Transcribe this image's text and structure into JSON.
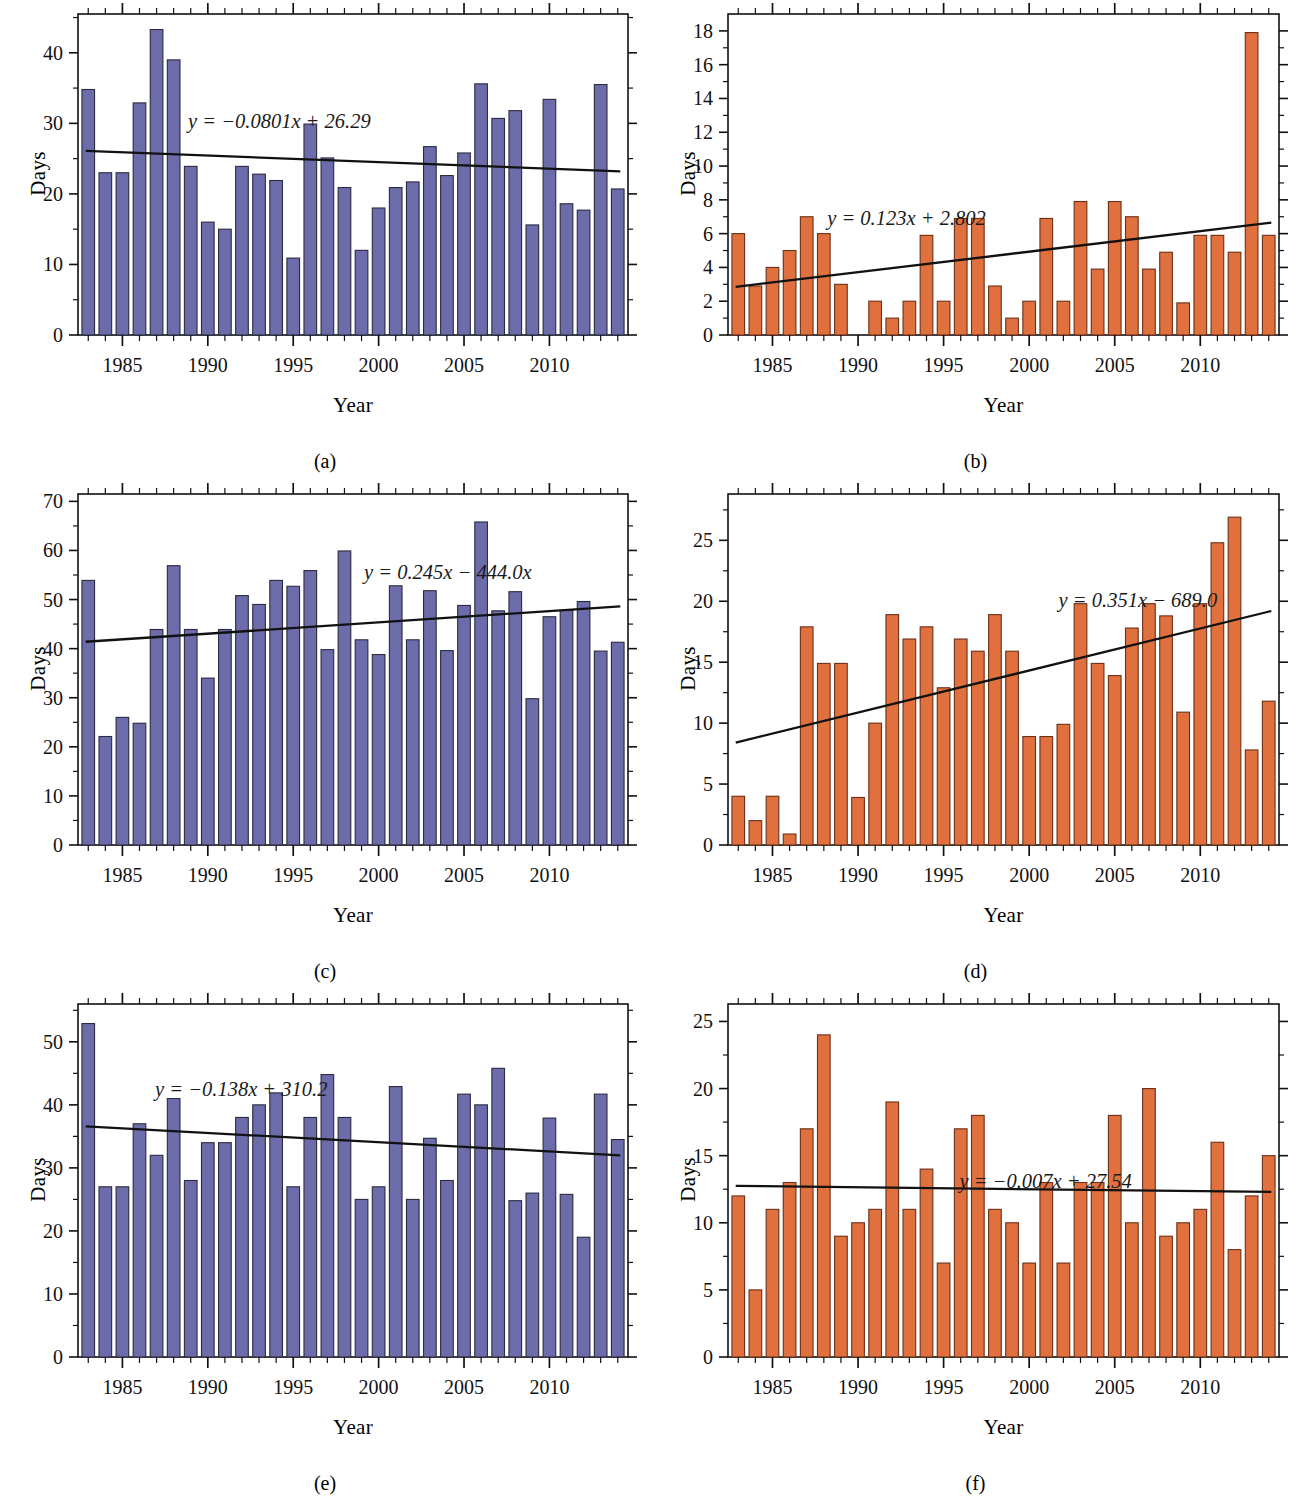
{
  "figure": {
    "background": "#ffffff",
    "purple": "#6d6caa",
    "purple_edge": "#2a2a40",
    "orange": "#e1703f",
    "orange_edge": "#6b2f16",
    "trend_color": "#111111",
    "axis_color": "#111111"
  },
  "panels": [
    {
      "id": "a",
      "caption": "(a)",
      "color_key": "purple",
      "chart_data": {
        "type": "bar",
        "title": "",
        "xlabel": "Year",
        "ylabel": "Days",
        "xlim": [
          1982.4,
          2014.6
        ],
        "ylim": [
          0,
          45.5
        ],
        "yticks": [
          0,
          10,
          20,
          30,
          40
        ],
        "ytick_labels": [
          "0",
          "10",
          "20",
          "30",
          "40"
        ],
        "xticks": [
          1985,
          1990,
          1995,
          2000,
          2005,
          2010
        ],
        "xtick_labels": [
          "1985",
          "1990",
          "1995",
          "2000",
          "2005",
          "2010"
        ],
        "grid": false,
        "categories": [
          1983,
          1984,
          1985,
          1986,
          1987,
          1988,
          1989,
          1990,
          1991,
          1992,
          1993,
          1994,
          1995,
          1996,
          1997,
          1998,
          1999,
          2000,
          2001,
          2002,
          2003,
          2004,
          2005,
          2006,
          2007,
          2008,
          2009,
          2010,
          2011,
          2012,
          2013,
          2014
        ],
        "values": [
          34.8,
          23.0,
          23.0,
          32.9,
          43.3,
          39.0,
          23.9,
          16.0,
          15.0,
          23.9,
          22.8,
          21.9,
          10.9,
          29.9,
          25.1,
          20.9,
          12.0,
          18.0,
          20.9,
          21.7,
          26.7,
          22.6,
          25.8,
          35.6,
          30.7,
          31.8,
          15.6,
          33.4,
          18.6,
          17.7,
          35.5,
          20.7
        ],
        "trendline": {
          "label": "y = −0.0801x + 26.29",
          "slope": -0.0801,
          "intercept_display": "26.29",
          "y_start": 26.1,
          "y_end": 23.2
        }
      }
    },
    {
      "id": "b",
      "caption": "(b)",
      "color_key": "orange",
      "chart_data": {
        "type": "bar",
        "title": "",
        "xlabel": "Year",
        "ylabel": "Days",
        "xlim": [
          1982.4,
          2014.6
        ],
        "ylim": [
          0,
          19.0
        ],
        "yticks": [
          0,
          2,
          4,
          6,
          8,
          10,
          12,
          14,
          16,
          18
        ],
        "ytick_labels": [
          "0",
          "2",
          "4",
          "6",
          "8",
          "10",
          "12",
          "14",
          "16",
          "18"
        ],
        "xticks": [
          1985,
          1990,
          1995,
          2000,
          2005,
          2010
        ],
        "xtick_labels": [
          "1985",
          "1990",
          "1995",
          "2000",
          "2005",
          "2010"
        ],
        "grid": false,
        "categories": [
          1983,
          1984,
          1985,
          1986,
          1987,
          1988,
          1989,
          1990,
          1991,
          1992,
          1993,
          1994,
          1995,
          1996,
          1997,
          1998,
          1999,
          2000,
          2001,
          2002,
          2003,
          2004,
          2005,
          2006,
          2007,
          2008,
          2009,
          2010,
          2011,
          2012,
          2013,
          2014
        ],
        "values": [
          6.0,
          2.9,
          4.0,
          5.0,
          7.0,
          6.0,
          3.0,
          0.0,
          2.0,
          1.0,
          2.0,
          5.9,
          2.0,
          6.9,
          6.9,
          2.9,
          1.0,
          2.0,
          6.9,
          2.0,
          7.9,
          3.9,
          7.9,
          7.0,
          3.9,
          4.9,
          1.9,
          5.9,
          5.9,
          4.9,
          17.9,
          5.9
        ],
        "trendline": {
          "label": "y = 0.123x + 2.802",
          "slope": 0.123,
          "intercept_display": "2.802",
          "y_start": 2.85,
          "y_end": 6.65
        }
      }
    },
    {
      "id": "c",
      "caption": "(c)",
      "color_key": "purple",
      "chart_data": {
        "type": "bar",
        "title": "",
        "xlabel": "Year",
        "ylabel": "Days",
        "xlim": [
          1982.4,
          2014.6
        ],
        "ylim": [
          0,
          71.5
        ],
        "yticks": [
          0,
          10,
          20,
          30,
          40,
          50,
          60,
          70
        ],
        "ytick_labels": [
          "0",
          "10",
          "20",
          "30",
          "40",
          "50",
          "60",
          "70"
        ],
        "xticks": [
          1985,
          1990,
          1995,
          2000,
          2005,
          2010
        ],
        "xtick_labels": [
          "1985",
          "1990",
          "1995",
          "2000",
          "2005",
          "2010"
        ],
        "grid": false,
        "categories": [
          1983,
          1984,
          1985,
          1986,
          1987,
          1988,
          1989,
          1990,
          1991,
          1992,
          1993,
          1994,
          1995,
          1996,
          1997,
          1998,
          1999,
          2000,
          2001,
          2002,
          2003,
          2004,
          2005,
          2006,
          2007,
          2008,
          2009,
          2010,
          2011,
          2012,
          2013,
          2014
        ],
        "values": [
          53.9,
          22.1,
          26.0,
          24.8,
          43.9,
          56.9,
          43.9,
          34.0,
          43.9,
          50.8,
          49.0,
          53.9,
          52.7,
          55.9,
          39.8,
          59.9,
          41.8,
          38.8,
          52.8,
          41.8,
          51.8,
          39.6,
          48.8,
          65.8,
          47.7,
          51.6,
          29.8,
          46.5,
          47.8,
          49.6,
          39.5,
          41.3
        ],
        "trendline": {
          "label": "y = 0.245x − 444.0x",
          "slope": 0.245,
          "intercept_display": "444.0x",
          "y_start": 41.4,
          "y_end": 48.6
        }
      }
    },
    {
      "id": "d",
      "caption": "(d)",
      "color_key": "orange",
      "chart_data": {
        "type": "bar",
        "title": "",
        "xlabel": "Year",
        "ylabel": "Days",
        "xlim": [
          1982.4,
          2014.6
        ],
        "ylim": [
          0,
          28.8
        ],
        "yticks": [
          0,
          5,
          10,
          15,
          20,
          25
        ],
        "ytick_labels": [
          "0",
          "5",
          "10",
          "15",
          "20",
          "25"
        ],
        "xticks": [
          1985,
          1990,
          1995,
          2000,
          2005,
          2010
        ],
        "xtick_labels": [
          "1985",
          "1990",
          "1995",
          "2000",
          "2005",
          "2010"
        ],
        "grid": false,
        "categories": [
          1983,
          1984,
          1985,
          1986,
          1987,
          1988,
          1989,
          1990,
          1991,
          1992,
          1993,
          1994,
          1995,
          1996,
          1997,
          1998,
          1999,
          2000,
          2001,
          2002,
          2003,
          2004,
          2005,
          2006,
          2007,
          2008,
          2009,
          2010,
          2011,
          2012,
          2013,
          2014
        ],
        "values": [
          4.0,
          2.0,
          4.0,
          0.9,
          17.9,
          14.9,
          14.9,
          3.9,
          10.0,
          18.9,
          16.9,
          17.9,
          12.9,
          16.9,
          15.9,
          18.9,
          15.9,
          8.9,
          8.9,
          9.9,
          19.8,
          14.9,
          13.9,
          17.8,
          19.8,
          18.8,
          10.9,
          19.8,
          24.8,
          26.9,
          7.8,
          11.8
        ],
        "trendline": {
          "label": "y = 0.351x − 689.0",
          "slope": 0.351,
          "intercept_display": "689.0",
          "y_start": 8.4,
          "y_end": 19.2
        }
      }
    },
    {
      "id": "e",
      "caption": "(e)",
      "color_key": "purple",
      "chart_data": {
        "type": "bar",
        "title": "",
        "xlabel": "Year",
        "ylabel": "Days",
        "xlim": [
          1982.4,
          2014.6
        ],
        "ylim": [
          0,
          56.0
        ],
        "yticks": [
          0,
          10,
          20,
          30,
          40,
          50
        ],
        "ytick_labels": [
          "0",
          "10",
          "20",
          "30",
          "40",
          "50"
        ],
        "xticks": [
          1985,
          1990,
          1995,
          2000,
          2005,
          2010
        ],
        "xtick_labels": [
          "1985",
          "1990",
          "1995",
          "2000",
          "2005",
          "2010"
        ],
        "grid": false,
        "categories": [
          1983,
          1984,
          1985,
          1986,
          1987,
          1988,
          1989,
          1990,
          1991,
          1992,
          1993,
          1994,
          1995,
          1996,
          1997,
          1998,
          1999,
          2000,
          2001,
          2002,
          2003,
          2004,
          2005,
          2006,
          2007,
          2008,
          2009,
          2010,
          2011,
          2012,
          2013,
          2014
        ],
        "values": [
          52.9,
          27.0,
          27.0,
          37.0,
          32.0,
          41.0,
          28.0,
          34.0,
          34.0,
          38.0,
          40.0,
          41.9,
          27.0,
          38.0,
          44.8,
          38.0,
          25.0,
          27.0,
          42.9,
          25.0,
          34.7,
          28.0,
          41.7,
          40.0,
          45.8,
          24.8,
          26.0,
          37.9,
          25.8,
          19.0,
          41.7,
          34.5
        ],
        "trendline": {
          "label": "y = −0.138x + 310.2",
          "slope": -0.138,
          "intercept_display": "310.2",
          "y_start": 36.6,
          "y_end": 32.0
        }
      }
    },
    {
      "id": "f",
      "caption": "(f)",
      "color_key": "orange",
      "chart_data": {
        "type": "bar",
        "title": "",
        "xlabel": "Year",
        "ylabel": "Days",
        "xlim": [
          1982.4,
          2014.6
        ],
        "ylim": [
          0,
          26.3
        ],
        "yticks": [
          0,
          5,
          10,
          15,
          20,
          25
        ],
        "ytick_labels": [
          "0",
          "5",
          "10",
          "15",
          "20",
          "25"
        ],
        "xticks": [
          1985,
          1990,
          1995,
          2000,
          2005,
          2010
        ],
        "xtick_labels": [
          "1985",
          "1990",
          "1995",
          "2000",
          "2005",
          "2010"
        ],
        "grid": false,
        "categories": [
          1983,
          1984,
          1985,
          1986,
          1987,
          1988,
          1989,
          1990,
          1991,
          1992,
          1993,
          1994,
          1995,
          1996,
          1997,
          1998,
          1999,
          2000,
          2001,
          2002,
          2003,
          2004,
          2005,
          2006,
          2007,
          2008,
          2009,
          2010,
          2011,
          2012,
          2013,
          2014
        ],
        "values": [
          12.0,
          5.0,
          11.0,
          13.0,
          17.0,
          24.0,
          9.0,
          10.0,
          11.0,
          19.0,
          11.0,
          14.0,
          7.0,
          17.0,
          18.0,
          11.0,
          10.0,
          7.0,
          13.0,
          7.0,
          13.0,
          13.0,
          18.0,
          10.0,
          20.0,
          9.0,
          10.0,
          11.0,
          16.0,
          8.0,
          12.0,
          15.0
        ],
        "trendline": {
          "label": "y = −0.007x + 27.54",
          "slope": -0.007,
          "intercept_display": "27.54",
          "y_start": 12.75,
          "y_end": 12.3
        }
      }
    }
  ]
}
